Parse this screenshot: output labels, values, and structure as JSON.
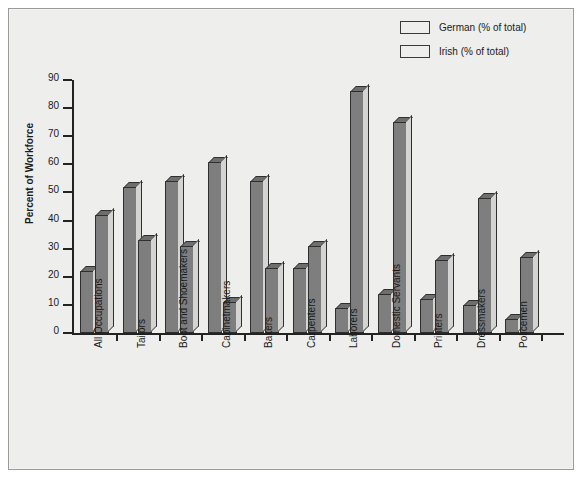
{
  "chart_data": {
    "type": "bar",
    "title": "",
    "xlabel": "",
    "ylabel": "Percent of Workforce",
    "ylim": [
      0,
      90
    ],
    "ytick_step": 10,
    "yticks": [
      0,
      10,
      20,
      30,
      40,
      50,
      60,
      70,
      80,
      90
    ],
    "grid": false,
    "legend_position": "top-right",
    "categories": [
      "All Occupations",
      "Tailors",
      "Boot and Shoemakers",
      "Cabinetmakers",
      "Bakers",
      "Carpenters",
      "Laborers",
      "Domestic Servants",
      "Printers",
      "Dressmakers",
      "Policemen"
    ],
    "series": [
      {
        "name": "German (% of total)",
        "color": "#7e7e7e",
        "values": [
          22,
          52,
          54,
          61,
          54,
          23,
          9,
          14,
          12,
          10,
          5
        ]
      },
      {
        "name": "Irish (% of total)",
        "color": "#7e7e7e",
        "values": [
          42,
          33,
          31,
          11,
          23,
          31,
          86,
          75,
          26,
          48,
          27
        ]
      }
    ]
  },
  "legend": {
    "entries": [
      {
        "label": "German (% of total)"
      },
      {
        "label": "Irish (% of total)"
      }
    ]
  },
  "axes": {
    "y_title": "Percent of Workforce"
  },
  "colors": {
    "bar_face": "#7e7e7e",
    "bar_top": "#6e6e6e",
    "bar_side": "#d4d4d2",
    "outline": "#2f2f2f",
    "axis": "#232323",
    "background": "#eeeeec",
    "text": "#1a1a1a"
  }
}
